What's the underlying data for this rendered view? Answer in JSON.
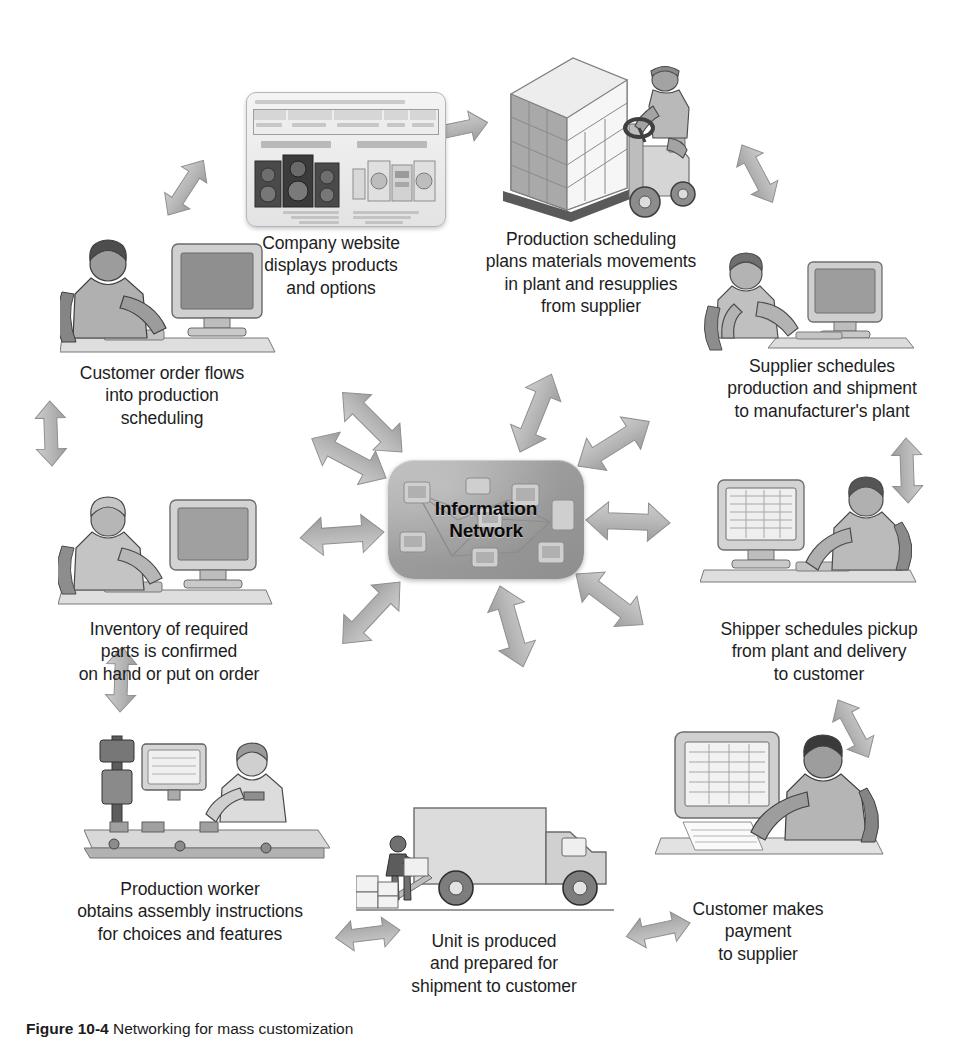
{
  "figure": {
    "number_label": "Figure 10-4",
    "caption_text": "Networking for mass customization"
  },
  "center": {
    "title": "Information\nNetwork",
    "node_name": "information-network-hub"
  },
  "colors": {
    "arrow_fill": "#b4b4b4",
    "arrow_stroke": "#8d8d8d",
    "center_fill": "#a0a0a0",
    "text": "#1d1d1d",
    "page_background": "#ffffff"
  },
  "nodes": [
    {
      "id": "company-website",
      "position": "top-left-upper",
      "label": "Company website\ndisplays products\nand options",
      "illustration": "website-product-page-thumbnail"
    },
    {
      "id": "production-scheduling",
      "position": "top-right-upper",
      "label": "Production scheduling\nplans materials movements\nin plant and resupplies\nfrom supplier",
      "illustration": "forklift-with-palletized-boxes"
    },
    {
      "id": "supplier-schedules",
      "position": "right-upper",
      "label": "Supplier schedules\nproduction and shipment\nto manufacturer's plant",
      "illustration": "seated-person-at-desktop-computer"
    },
    {
      "id": "shipper-schedules",
      "position": "right-lower",
      "label": "Shipper schedules pickup\nfrom plant and delivery\nto customer",
      "illustration": "person-typing-at-monitor"
    },
    {
      "id": "customer-payment",
      "position": "bottom-right",
      "label": "Customer makes\npayment\nto supplier",
      "illustration": "person-at-monitor-with-documents"
    },
    {
      "id": "unit-produced",
      "position": "bottom-center",
      "label": "Unit is produced\nand prepared for\nshipment to customer",
      "illustration": "delivery-truck-being-loaded"
    },
    {
      "id": "production-worker",
      "position": "bottom-left",
      "label": "Production worker\nobtains assembly instructions\nfor choices and features",
      "illustration": "worker-at-assembly-line-terminal"
    },
    {
      "id": "inventory-check",
      "position": "left-lower",
      "label": "Inventory of required\nparts is confirmed\non hand or put on order",
      "illustration": "person-at-keyboard-and-monitor"
    },
    {
      "id": "customer-order",
      "position": "left-upper",
      "label": "Customer order flows\ninto production\nscheduling",
      "illustration": "person-at-desktop-computer"
    }
  ],
  "arrows": [
    {
      "id": "arrow-company-website",
      "direction": "bidirectional",
      "connects": "center-to-company-website"
    },
    {
      "id": "arrow-production-scheduling",
      "direction": "bidirectional",
      "connects": "center-to-production-scheduling"
    },
    {
      "id": "arrow-supplier-schedules",
      "direction": "bidirectional",
      "connects": "center-to-supplier-schedules"
    },
    {
      "id": "arrow-shipper-schedules",
      "direction": "bidirectional",
      "connects": "center-to-shipper-schedules"
    },
    {
      "id": "arrow-customer-payment",
      "direction": "bidirectional",
      "connects": "center-to-customer-payment"
    },
    {
      "id": "arrow-unit-produced",
      "direction": "bidirectional",
      "connects": "center-to-unit-produced"
    },
    {
      "id": "arrow-production-worker",
      "direction": "bidirectional",
      "connects": "center-to-production-worker"
    },
    {
      "id": "arrow-inventory-check",
      "direction": "bidirectional",
      "connects": "center-to-inventory-check"
    },
    {
      "id": "arrow-customer-order",
      "direction": "bidirectional",
      "connects": "center-to-customer-order"
    },
    {
      "id": "arrow-website-to-scheduling",
      "direction": "bidirectional",
      "connects": "company-website-to-production-scheduling"
    },
    {
      "id": "arrow-order-to-website",
      "direction": "bidirectional",
      "connects": "customer-order-to-company-website"
    },
    {
      "id": "arrow-scheduling-to-supplier",
      "direction": "bidirectional",
      "connects": "production-scheduling-to-supplier"
    },
    {
      "id": "arrow-supplier-to-shipper",
      "direction": "bidirectional",
      "connects": "supplier-to-shipper"
    },
    {
      "id": "arrow-shipper-to-payment",
      "direction": "bidirectional",
      "connects": "shipper-to-customer-payment"
    },
    {
      "id": "arrow-payment-to-unit",
      "direction": "bidirectional",
      "connects": "customer-payment-to-unit-produced"
    },
    {
      "id": "arrow-unit-to-worker",
      "direction": "bidirectional",
      "connects": "unit-produced-to-production-worker"
    },
    {
      "id": "arrow-worker-to-inventory",
      "direction": "bidirectional",
      "connects": "production-worker-to-inventory"
    },
    {
      "id": "arrow-inventory-to-order",
      "direction": "bidirectional",
      "connects": "inventory-to-customer-order"
    }
  ]
}
